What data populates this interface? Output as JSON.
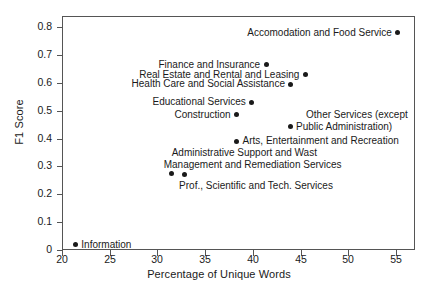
{
  "chart_data": {
    "type": "scatter",
    "title": "",
    "xlabel": "Percentage of Unique Words",
    "ylabel": "F1 Score",
    "xlim": [
      20,
      57
    ],
    "ylim": [
      0,
      0.84
    ],
    "grid": false,
    "legend": "none",
    "xticks": [
      "20",
      "25",
      "30",
      "35",
      "40",
      "45",
      "50",
      "55"
    ],
    "xtick_values": [
      20,
      25,
      30,
      35,
      40,
      45,
      50,
      55
    ],
    "yticks": [
      "0",
      "0.1",
      "0.2",
      "0.3",
      "0.4",
      "0.5",
      "0.6",
      "0.7",
      "0.8"
    ],
    "ytick_values": [
      0,
      0.1,
      0.2,
      0.3,
      0.4,
      0.5,
      0.6,
      0.7,
      0.8
    ],
    "marker_color": "#1a1a1a",
    "points": [
      {
        "label": "Accomodation and Food Service",
        "x": 55.2,
        "y": 0.78,
        "label_side": "left"
      },
      {
        "label": "Finance and Insurance",
        "x": 41.4,
        "y": 0.665,
        "label_side": "left"
      },
      {
        "label": "Real Estate and Rental and Leasing",
        "x": 45.5,
        "y": 0.63,
        "label_side": "left"
      },
      {
        "label": "Health Care and Social Assistance",
        "x": 44.0,
        "y": 0.595,
        "label_side": "left"
      },
      {
        "label": "Educational Services",
        "x": 39.9,
        "y": 0.53,
        "label_side": "left"
      },
      {
        "label": "Construction",
        "x": 38.3,
        "y": 0.485,
        "label_side": "left"
      },
      {
        "label": "Other Services (except Public Administration)",
        "label_line1": "Other Services (except",
        "label_line2": "Public Administration)",
        "x": 43.9,
        "y": 0.445,
        "label_side": "right"
      },
      {
        "label": "Arts, Entertainment and Recreation",
        "x": 38.3,
        "y": 0.39,
        "label_side": "right"
      },
      {
        "label": "Administrative Support and Wast Management and Remediation Services",
        "label_line1": "Administrative Support and Wast",
        "label_line2": "Management and Remediation Services",
        "x": 31.5,
        "y": 0.275,
        "label_side": "above"
      },
      {
        "label": "Prof., Scientific and Tech. Services",
        "x": 32.8,
        "y": 0.27,
        "label_side": "below"
      },
      {
        "label": "Information",
        "x": 21.4,
        "y": 0.018,
        "label_side": "right"
      }
    ]
  }
}
